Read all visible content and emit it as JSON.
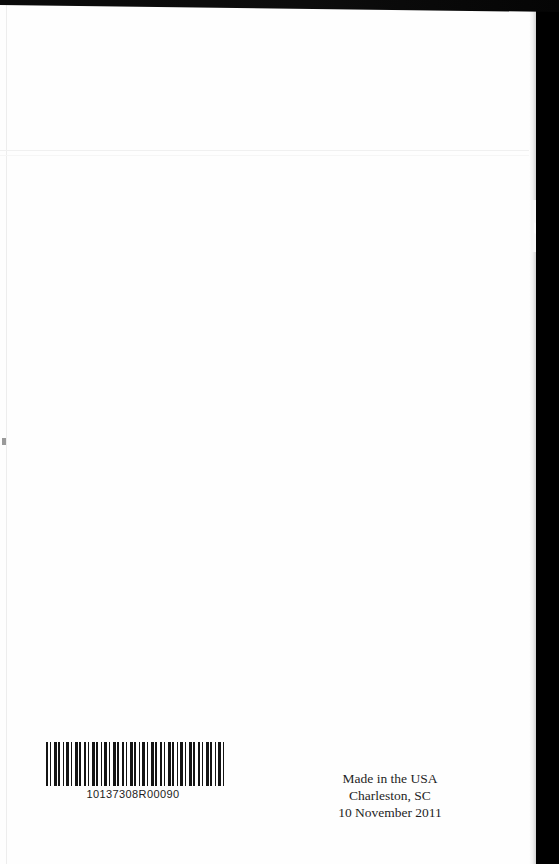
{
  "page": {
    "type": "scanned-book-back-cover",
    "background_color": "#000000",
    "paper_color": "#fefefe"
  },
  "barcode": {
    "name": "barcode-icon",
    "number": "10137308R00090"
  },
  "imprint": {
    "line1": "Made in the USA",
    "line2": "Charleston, SC",
    "line3": "10 November 2011"
  }
}
